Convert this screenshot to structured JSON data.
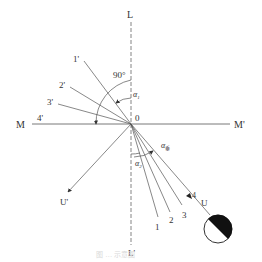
{
  "diagram": {
    "type": "angle-geometry",
    "colors": {
      "line": "#555555",
      "text": "#333333",
      "fill_dark": "#111111",
      "background": "#ffffff"
    },
    "axes": {
      "vertical": {
        "start_label": "L",
        "end_label": "L'",
        "style": "dashed"
      },
      "horizontal": {
        "start_label": "M",
        "end_label": "M'",
        "style": "solid"
      },
      "origin_label": "0"
    },
    "upper_rays": [
      {
        "label": "1'"
      },
      {
        "label": "2'"
      },
      {
        "label": "3'"
      },
      {
        "label": "4'"
      }
    ],
    "lower_rays": [
      {
        "label": "1"
      },
      {
        "label": "2"
      },
      {
        "label": "3"
      },
      {
        "label": "4"
      }
    ],
    "vectors": {
      "incident": {
        "label": "U"
      },
      "reflected": {
        "label": "U'"
      }
    },
    "angles": {
      "right_angle": "90°",
      "alpha1": {
        "symbol": "α",
        "sub": "1"
      },
      "alpha2": {
        "symbol": "α",
        "sub": "2"
      },
      "alpha_perp": {
        "symbol": "α",
        "sub": "垂"
      }
    },
    "source": {
      "shape": "half-filled-circle"
    },
    "caption": "图 … 示意图"
  }
}
